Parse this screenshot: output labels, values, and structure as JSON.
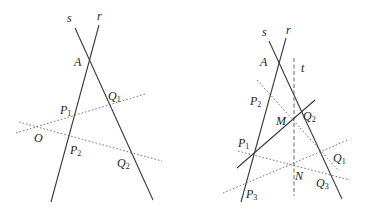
{
  "left_figure": {
    "lines": {
      "r": {
        "x1": 99,
        "y1": 25,
        "x2": 51,
        "y2": 202
      },
      "s": {
        "x1": 75,
        "y1": 28,
        "x2": 153,
        "y2": 200
      },
      "O_Q1": {
        "x1": 16,
        "y1": 133,
        "x2": 145,
        "y2": 94
      },
      "O_Q2": {
        "x1": 19,
        "y1": 122,
        "x2": 162,
        "y2": 161
      }
    },
    "labels": {
      "s": "s",
      "r": "r",
      "A": "A",
      "Q1": "Q",
      "Q1_sub": "1",
      "P1": "P",
      "P1_sub": "1",
      "O": "O",
      "P2": "P",
      "P2_sub": "2",
      "Q2": "Q",
      "Q2_sub": "2"
    }
  },
  "right_figure": {
    "lines": {
      "r": {
        "x1": 286,
        "y1": 38,
        "x2": 241,
        "y2": 202
      },
      "s": {
        "x1": 269,
        "y1": 41,
        "x2": 342,
        "y2": 199
      },
      "t": {
        "x1": 294,
        "y1": 58,
        "x2": 294,
        "y2": 196
      },
      "P1_M": {
        "x1": 237,
        "y1": 168,
        "x2": 315,
        "y2": 100
      },
      "P2_Q1": {
        "x1": 257,
        "y1": 80,
        "x2": 338,
        "y2": 170
      },
      "P1_Q3": {
        "x1": 238,
        "y1": 151,
        "x2": 350,
        "y2": 180
      },
      "P3_Q1": {
        "x1": 223,
        "y1": 193,
        "x2": 348,
        "y2": 140
      }
    },
    "labels": {
      "s": "s",
      "r": "r",
      "A": "A",
      "t": "t",
      "P2": "P",
      "P2_sub": "2",
      "M": "M",
      "Q2": "Q",
      "Q2_sub": "2",
      "P1": "P",
      "P1_sub": "1",
      "Q1": "Q",
      "Q1_sub": "1",
      "N": "N",
      "Q3": "Q",
      "Q3_sub": "3",
      "P3": "P",
      "P3_sub": "3"
    }
  }
}
